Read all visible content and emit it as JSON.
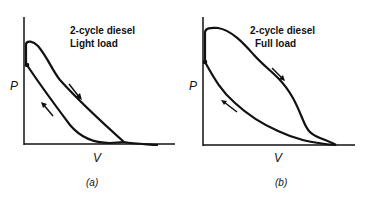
{
  "panels": [
    {
      "id": "a",
      "title_line1": "2-cycle diesel",
      "title_line2": "Light load",
      "y_axis_label": "P",
      "x_axis_label": "V",
      "caption": "(a)"
    },
    {
      "id": "b",
      "title_line1": "2-cycle diesel",
      "title_line2": "Full load",
      "y_axis_label": "P",
      "x_axis_label": "V",
      "caption": "(b)"
    }
  ],
  "colors": {
    "ink": "#111111",
    "background": "#ffffff"
  }
}
